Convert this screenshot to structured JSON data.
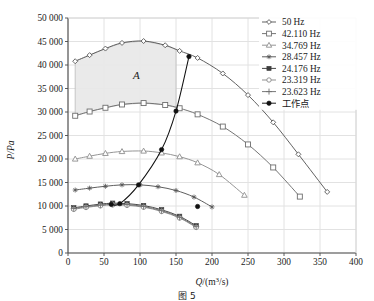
{
  "chart_data": {
    "type": "line",
    "title": "",
    "xlabel": "Q/(m3/s)",
    "ylabel": "P/Pa",
    "xlim": [
      0,
      400
    ],
    "ylim": [
      0,
      50000
    ],
    "xticks": [
      "0",
      "50",
      "100",
      "150",
      "200",
      "250",
      "300",
      "350",
      "400"
    ],
    "yticks": [
      "0",
      "5 000",
      "10 000",
      "15 000",
      "20 000",
      "25 000",
      "30 000",
      "35 000",
      "40 000",
      "45 000",
      "50 000"
    ],
    "grid": true,
    "legend_position": "top-right",
    "annotations": [
      {
        "label": "A",
        "x": 95,
        "y": 37000,
        "note": "shaded operating region"
      }
    ],
    "shaded_region": {
      "label": "A",
      "x_range": [
        10,
        150
      ],
      "y_upper_series": "50 Hz",
      "y_lower_series": "42.110 Hz"
    },
    "series": [
      {
        "name": "50 Hz",
        "marker": "open-diamond",
        "color": "#585858",
        "x": [
          10,
          30,
          52,
          75,
          105,
          135,
          155,
          180,
          215,
          250,
          285,
          320,
          360
        ],
        "y": [
          40800,
          42100,
          43500,
          44700,
          45100,
          44200,
          43000,
          41500,
          38200,
          33600,
          27800,
          21000,
          13000
        ]
      },
      {
        "name": "42.110 Hz",
        "marker": "open-square",
        "color": "#6e6e6e",
        "x": [
          10,
          30,
          52,
          75,
          105,
          135,
          155,
          180,
          215,
          250,
          285,
          322
        ],
        "y": [
          29200,
          30100,
          30900,
          31600,
          31900,
          31500,
          30800,
          29500,
          26900,
          23100,
          18200,
          12000
        ]
      },
      {
        "name": "34.769 Hz",
        "marker": "open-triangle",
        "color": "#8f8f8f",
        "x": [
          10,
          30,
          52,
          75,
          105,
          130,
          155,
          180,
          210,
          245
        ],
        "y": [
          20000,
          20600,
          21200,
          21600,
          21700,
          21300,
          20500,
          19200,
          16700,
          12300
        ]
      },
      {
        "name": "28.457 Hz",
        "marker": "star",
        "color": "#555555",
        "x": [
          10,
          30,
          52,
          75,
          100,
          125,
          150,
          175,
          200
        ],
        "y": [
          13400,
          13800,
          14200,
          14500,
          14500,
          14100,
          13300,
          11900,
          9800
        ]
      },
      {
        "name": "24.176 Hz",
        "marker": "filled-square",
        "color": "#3d3d3d",
        "x": [
          8,
          25,
          45,
          62,
          82,
          105,
          130,
          155,
          178
        ],
        "y": [
          9600,
          10000,
          10400,
          10600,
          10500,
          10100,
          9200,
          7800,
          5800
        ]
      },
      {
        "name": "23.319 Hz",
        "marker": "open-circle",
        "color": "#8a8a8a",
        "x": [
          8,
          25,
          45,
          62,
          82,
          105,
          130,
          155,
          178
        ],
        "y": [
          9300,
          9700,
          10050,
          10250,
          10150,
          9750,
          8850,
          7450,
          5450
        ]
      },
      {
        "name": "23.623 Hz",
        "marker": "plus",
        "color": "#707070",
        "x": [
          8,
          25,
          45,
          62,
          82,
          105,
          130,
          155,
          178
        ],
        "y": [
          9450,
          9850,
          10200,
          10400,
          10300,
          9900,
          9000,
          7600,
          5600
        ]
      },
      {
        "name": "工作点",
        "marker": "filled-circle",
        "color": "#111111",
        "system_curve": true,
        "x": [
          60,
          98,
          130,
          150,
          168,
          180
        ],
        "y": [
          10350,
          14500,
          22000,
          30200,
          41800,
          9900
        ]
      }
    ],
    "operating_points": [
      {
        "x": 150,
        "y": 30200
      },
      {
        "x": 168,
        "y": 41800
      },
      {
        "x": 130,
        "y": 22000
      },
      {
        "x": 98,
        "y": 14500
      },
      {
        "x": 72,
        "y": 10500
      },
      {
        "x": 60,
        "y": 10350
      },
      {
        "x": 180,
        "y": 9900
      }
    ]
  },
  "legend": {
    "items": [
      {
        "label": "50 Hz",
        "marker": "open-diamond",
        "color": "#585858"
      },
      {
        "label": "42.110 Hz",
        "marker": "open-square",
        "color": "#6e6e6e"
      },
      {
        "label": "34.769 Hz",
        "marker": "open-triangle",
        "color": "#8f8f8f"
      },
      {
        "label": "28.457 Hz",
        "marker": "star",
        "color": "#555555"
      },
      {
        "label": "24.176 Hz",
        "marker": "filled-square",
        "color": "#3d3d3d"
      },
      {
        "label": "23.319 Hz",
        "marker": "open-circle",
        "color": "#8a8a8a"
      },
      {
        "label": "23.623 Hz",
        "marker": "plus",
        "color": "#707070"
      },
      {
        "label": "工作点",
        "marker": "filled-circle",
        "color": "#111111"
      }
    ]
  },
  "axes": {
    "y_axis_title": "P/Pa",
    "x_axis_title_main": "Q",
    "x_axis_title_unit_open": "/(m",
    "x_axis_title_exp": "3",
    "x_axis_title_unit_close": "/s)"
  },
  "region": {
    "label": "A"
  },
  "caption": {
    "text": "图 5"
  },
  "colors": {
    "axis": "#4a4a4a",
    "grid": "#e2e2e2",
    "shaded_fill": "#e9e9e9",
    "shaded_stroke": "#b9b9b9",
    "background": "#ffffff"
  }
}
